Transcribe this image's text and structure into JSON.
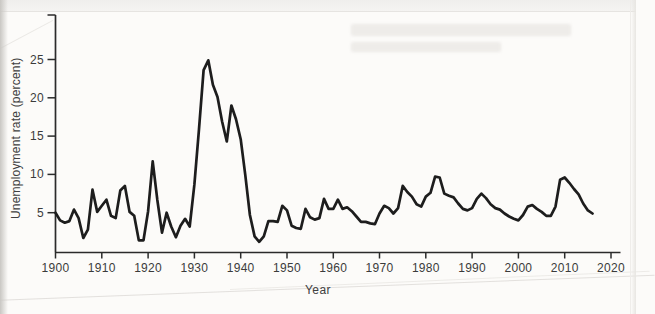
{
  "chart_data": {
    "type": "line",
    "title": "",
    "xlabel": "Year",
    "ylabel": "Unemployment rate (percent)",
    "x_ticks": [
      1900,
      1910,
      1920,
      1930,
      1940,
      1950,
      1960,
      1970,
      1980,
      1990,
      2000,
      2010,
      2020
    ],
    "y_ticks": [
      5,
      10,
      15,
      20,
      25
    ],
    "xlim": [
      1900,
      2022
    ],
    "ylim": [
      0,
      30
    ],
    "grid": false,
    "legend": "none",
    "line_color": "#1d1d1d",
    "series": [
      {
        "name": "US unemployment rate (percent)",
        "x": [
          1900,
          1901,
          1902,
          1903,
          1904,
          1905,
          1906,
          1907,
          1908,
          1909,
          1910,
          1911,
          1912,
          1913,
          1914,
          1915,
          1916,
          1917,
          1918,
          1919,
          1920,
          1921,
          1922,
          1923,
          1924,
          1925,
          1926,
          1927,
          1928,
          1929,
          1930,
          1931,
          1932,
          1933,
          1934,
          1935,
          1936,
          1937,
          1938,
          1939,
          1940,
          1941,
          1942,
          1943,
          1944,
          1945,
          1946,
          1947,
          1948,
          1949,
          1950,
          1951,
          1952,
          1953,
          1954,
          1955,
          1956,
          1957,
          1958,
          1959,
          1960,
          1961,
          1962,
          1963,
          1964,
          1965,
          1966,
          1967,
          1968,
          1969,
          1970,
          1971,
          1972,
          1973,
          1974,
          1975,
          1976,
          1977,
          1978,
          1979,
          1980,
          1981,
          1982,
          1983,
          1984,
          1985,
          1986,
          1987,
          1988,
          1989,
          1990,
          1991,
          1992,
          1993,
          1994,
          1995,
          1996,
          1997,
          1998,
          1999,
          2000,
          2001,
          2002,
          2003,
          2004,
          2005,
          2006,
          2007,
          2008,
          2009,
          2010,
          2011,
          2012,
          2013,
          2014,
          2015,
          2016
        ],
        "values": [
          5.0,
          4.0,
          3.7,
          3.9,
          5.4,
          4.3,
          1.7,
          2.8,
          8.0,
          5.1,
          5.9,
          6.7,
          4.6,
          4.3,
          7.9,
          8.5,
          5.1,
          4.6,
          1.4,
          1.4,
          5.2,
          11.7,
          6.7,
          2.4,
          5.0,
          3.2,
          1.8,
          3.3,
          4.2,
          3.2,
          8.7,
          15.9,
          23.6,
          24.9,
          21.7,
          20.1,
          16.9,
          14.3,
          19.0,
          17.2,
          14.6,
          9.9,
          4.7,
          1.9,
          1.2,
          1.9,
          3.9,
          3.9,
          3.8,
          5.9,
          5.3,
          3.3,
          3.0,
          2.9,
          5.5,
          4.4,
          4.1,
          4.3,
          6.8,
          5.5,
          5.5,
          6.7,
          5.5,
          5.7,
          5.2,
          4.5,
          3.8,
          3.8,
          3.6,
          3.5,
          4.9,
          5.9,
          5.6,
          4.9,
          5.6,
          8.5,
          7.7,
          7.1,
          6.1,
          5.8,
          7.1,
          7.6,
          9.7,
          9.6,
          7.5,
          7.2,
          7.0,
          6.2,
          5.5,
          5.3,
          5.6,
          6.8,
          7.5,
          6.9,
          6.1,
          5.6,
          5.4,
          4.9,
          4.5,
          4.2,
          4.0,
          4.7,
          5.8,
          6.0,
          5.5,
          5.1,
          4.6,
          4.6,
          5.8,
          9.3,
          9.6,
          8.9,
          8.1,
          7.4,
          6.2,
          5.3,
          4.9
        ]
      }
    ]
  }
}
